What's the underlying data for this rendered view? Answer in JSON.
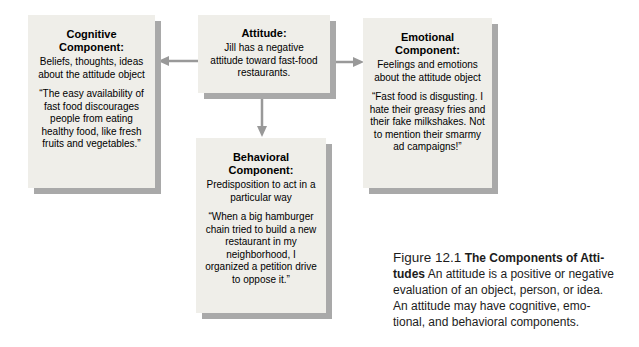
{
  "figure": {
    "boxes": {
      "attitude": {
        "title": "Attitude:",
        "description": "Jill has a negative attitude toward fast-food restaurants."
      },
      "cognitive": {
        "title": "Cognitive Component:",
        "description": "Beliefs, thoughts, ideas about the attitude object",
        "quote": "“The easy availability of fast food discourages people from eating healthy food, like fresh fruits and vegetables.”"
      },
      "emotional": {
        "title": "Emotional Component:",
        "description": "Feelings and emotions about the attitude object",
        "quote": "“Fast food is disgusting. I hate their greasy fries and their fake milkshakes. Not to mention their smarmy ad campaigns!”"
      },
      "behavioral": {
        "title": "Behavioral Component:",
        "description": "Predisposition to act in a particular way",
        "quote": "“When a big hamburger chain tried to build a new restaurant in my neighborhood, I organized a petition drive to oppose it.”"
      }
    },
    "arrows": [
      {
        "name": "attitude-to-cognitive",
        "direction": "left"
      },
      {
        "name": "attitude-to-emotional",
        "direction": "right"
      },
      {
        "name": "attitude-to-behavioral",
        "direction": "down"
      }
    ],
    "caption": {
      "figure_label": "Figure 12.1",
      "title_line1": "The Components of Atti-",
      "title_line2": "tudes",
      "body_line1": " An attitude is a positive or negative",
      "body_line2": "evaluation of an object, person, or idea.",
      "body_line3": "An attitude may have cognitive, emo-",
      "body_line4": "tional, and behavioral components."
    },
    "colors": {
      "background": "#ffffff",
      "box_fill": "#efeee9",
      "box_shadow": "#a9a9a9",
      "arrow": "#999999",
      "text": "#000000"
    }
  }
}
